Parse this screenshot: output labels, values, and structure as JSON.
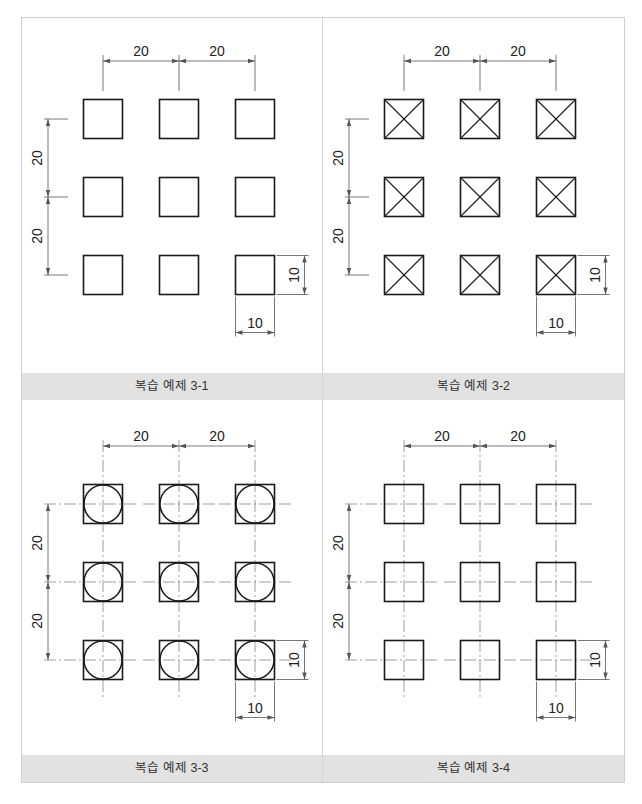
{
  "colors": {
    "outline": "#1a1a1a",
    "dimension": "#555555",
    "centerline": "#777777",
    "caption_bg": "#e2e2e2",
    "border": "#cfcfcf"
  },
  "units": {
    "pitch": 20,
    "size": 10
  },
  "panels": [
    {
      "caption": "복습 예제 3-1",
      "style": "plain-square",
      "dims": {
        "h1": "20",
        "h2": "20",
        "v1": "20",
        "v2": "20",
        "w": "10",
        "h": "10"
      }
    },
    {
      "caption": "복습 예제 3-2",
      "style": "square-with-x",
      "dims": {
        "h1": "20",
        "h2": "20",
        "v1": "20",
        "v2": "20",
        "w": "10",
        "h": "10"
      }
    },
    {
      "caption": "복습 예제 3-3",
      "style": "square-with-circle-centerlines",
      "dims": {
        "h1": "20",
        "h2": "20",
        "v1": "20",
        "v2": "20",
        "w": "10",
        "h": "10"
      }
    },
    {
      "caption": "복습 예제 3-4",
      "style": "square-with-centerlines",
      "dims": {
        "h1": "20",
        "h2": "20",
        "v1": "20",
        "v2": "20",
        "w": "10",
        "h": "10"
      }
    }
  ],
  "grid": {
    "rows": 3,
    "cols": 3
  }
}
